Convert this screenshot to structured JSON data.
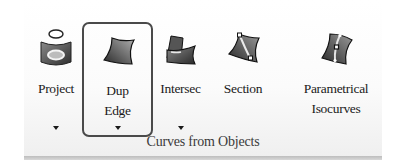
{
  "panel": {
    "title": "Curves from Objects"
  },
  "buttons": [
    {
      "id": "project",
      "label_line1": "Project",
      "label_line2": "",
      "icon": "project-curve-icon",
      "has_dropdown": true,
      "selected": false
    },
    {
      "id": "dup-edge",
      "label_line1": "Dup",
      "label_line2": "Edge",
      "icon": "duplicate-edge-icon",
      "has_dropdown": true,
      "selected": true
    },
    {
      "id": "intersect",
      "label_line1": "Intersec",
      "label_line2": "",
      "icon": "intersect-icon",
      "has_dropdown": true,
      "selected": false
    },
    {
      "id": "section",
      "label_line1": "Section",
      "label_line2": "",
      "icon": "section-icon",
      "has_dropdown": false,
      "selected": false
    },
    {
      "id": "parametrical-isocurves",
      "label_line1": "Parametrical",
      "label_line2": "Isocurves",
      "icon": "isocurves-icon",
      "has_dropdown": false,
      "selected": false
    }
  ],
  "colors": {
    "selection_border": "#4a4a4a",
    "text": "#1a1a1a",
    "panel_title": "#3a3a3a",
    "bottom_bar": "#c4c4c4"
  }
}
